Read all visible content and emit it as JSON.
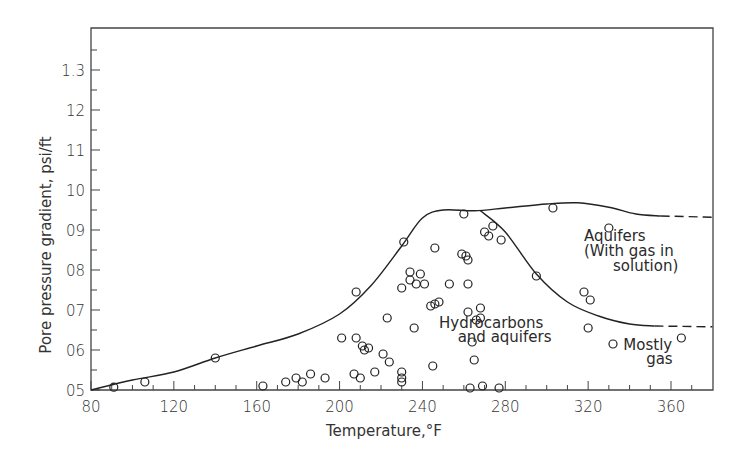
{
  "chart_data": {
    "type": "scatter",
    "title": "",
    "xlabel": "Temperature,°F",
    "ylabel": "Pore pressure gradient, psi/ft",
    "xlim": [
      80,
      380
    ],
    "ylim": [
      0.5,
      1.38
    ],
    "grid": false,
    "legend": null,
    "x_ticks": [
      80,
      120,
      160,
      200,
      240,
      280,
      320,
      360
    ],
    "x_tick_labels": [
      "80",
      "120",
      "160",
      "200",
      "240",
      "280",
      "320",
      "360"
    ],
    "y_ticks": [
      0.5,
      0.6,
      0.7,
      0.8,
      0.9,
      1.0,
      1.1,
      1.2,
      1.3
    ],
    "y_tick_labels": [
      "05",
      "06",
      "07",
      "08",
      "09",
      "10",
      "11",
      "12",
      "1.3"
    ],
    "annotations": [
      {
        "text": "Aquifers",
        "x": 318,
        "y": 0.872
      },
      {
        "text": "(With gas in",
        "x": 318,
        "y": 0.835
      },
      {
        "text": "solution)",
        "x": 332,
        "y": 0.797
      },
      {
        "text": "Hydrocarbons",
        "x": 248,
        "y": 0.655
      },
      {
        "text": "and aquifers",
        "x": 257,
        "y": 0.62
      },
      {
        "text": "Mostly",
        "x": 337,
        "y": 0.6
      },
      {
        "text": "gas",
        "x": 348,
        "y": 0.565
      }
    ],
    "curves": [
      {
        "name": "Upper envelope",
        "style": "solid",
        "points": [
          [
            80,
            0.5
          ],
          [
            100,
            0.525
          ],
          [
            120,
            0.545
          ],
          [
            140,
            0.58
          ],
          [
            160,
            0.61
          ],
          [
            180,
            0.64
          ],
          [
            200,
            0.69
          ],
          [
            215,
            0.76
          ],
          [
            230,
            0.86
          ],
          [
            240,
            0.93
          ],
          [
            250,
            0.95
          ],
          [
            265,
            0.948
          ],
          [
            280,
            0.955
          ],
          [
            300,
            0.965
          ],
          [
            315,
            0.968
          ],
          [
            330,
            0.957
          ],
          [
            343,
            0.94
          ],
          [
            355,
            0.935
          ]
        ]
      },
      {
        "name": "Upper envelope (extrapolated)",
        "style": "dashed",
        "points": [
          [
            355,
            0.935
          ],
          [
            380,
            0.932
          ]
        ]
      },
      {
        "name": "Lower envelope (hydrocarbon/aquifer boundary)",
        "style": "solid",
        "points": [
          [
            268,
            0.948
          ],
          [
            280,
            0.895
          ],
          [
            295,
            0.79
          ],
          [
            310,
            0.72
          ],
          [
            325,
            0.685
          ],
          [
            340,
            0.665
          ],
          [
            352,
            0.66
          ]
        ]
      },
      {
        "name": "Lower envelope (extrapolated)",
        "style": "dashed",
        "points": [
          [
            352,
            0.66
          ],
          [
            380,
            0.658
          ]
        ]
      }
    ],
    "series": [
      {
        "name": "Observations",
        "marker": "open-circle",
        "points": [
          [
            91,
            0.507
          ],
          [
            106,
            0.52
          ],
          [
            140,
            0.58
          ],
          [
            163,
            0.51
          ],
          [
            174,
            0.52
          ],
          [
            179,
            0.53
          ],
          [
            182,
            0.52
          ],
          [
            186,
            0.54
          ],
          [
            193,
            0.53
          ],
          [
            201,
            0.63
          ],
          [
            207,
            0.54
          ],
          [
            208,
            0.63
          ],
          [
            210,
            0.53
          ],
          [
            211,
            0.61
          ],
          [
            212,
            0.6
          ],
          [
            214,
            0.605
          ],
          [
            217,
            0.545
          ],
          [
            221,
            0.59
          ],
          [
            224,
            0.57
          ],
          [
            208,
            0.745
          ],
          [
            223,
            0.68
          ],
          [
            230,
            0.755
          ],
          [
            230,
            0.545
          ],
          [
            230,
            0.53
          ],
          [
            230,
            0.52
          ],
          [
            231,
            0.87
          ],
          [
            234,
            0.795
          ],
          [
            234,
            0.775
          ],
          [
            236,
            0.655
          ],
          [
            237,
            0.765
          ],
          [
            239,
            0.79
          ],
          [
            241,
            0.765
          ],
          [
            244,
            0.71
          ],
          [
            245,
            0.56
          ],
          [
            246,
            0.855
          ],
          [
            246,
            0.715
          ],
          [
            248,
            0.72
          ],
          [
            253,
            0.765
          ],
          [
            259,
            0.84
          ],
          [
            260,
            0.94
          ],
          [
            261,
            0.835
          ],
          [
            262,
            0.825
          ],
          [
            262,
            0.765
          ],
          [
            262,
            0.695
          ],
          [
            263,
            0.505
          ],
          [
            264,
            0.62
          ],
          [
            265,
            0.575
          ],
          [
            266,
            0.675
          ],
          [
            268,
            0.705
          ],
          [
            268,
            0.68
          ],
          [
            269,
            0.51
          ],
          [
            270,
            0.895
          ],
          [
            272,
            0.885
          ],
          [
            274,
            0.91
          ],
          [
            277,
            0.505
          ],
          [
            278,
            0.875
          ],
          [
            295,
            0.785
          ],
          [
            303,
            0.955
          ],
          [
            318,
            0.745
          ],
          [
            320,
            0.655
          ],
          [
            321,
            0.725
          ],
          [
            330,
            0.905
          ],
          [
            332,
            0.615
          ],
          [
            365,
            0.63
          ]
        ]
      }
    ]
  }
}
